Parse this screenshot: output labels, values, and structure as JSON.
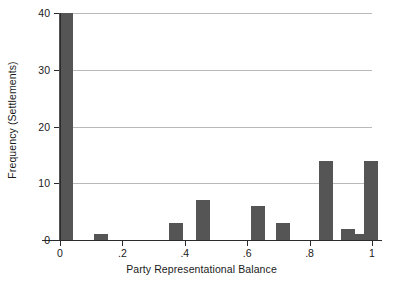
{
  "chart_data": {
    "type": "bar",
    "title": "",
    "xlabel": "Party Representational Balance",
    "ylabel": "Frequency (Settlements)",
    "xlim": [
      0,
      1
    ],
    "ylim": [
      0,
      40
    ],
    "grid": true,
    "legend": null,
    "bar_color": "#555555",
    "grid_color": "#b9b9b9",
    "axis_color": "#2b2b2b",
    "bin_width": 0.045,
    "xticks": [
      {
        "value": 0,
        "label": "0"
      },
      {
        "value": 0.2,
        "label": ".2"
      },
      {
        "value": 0.4,
        "label": ".4"
      },
      {
        "value": 0.6,
        "label": ".6"
      },
      {
        "value": 0.8,
        "label": ".8"
      },
      {
        "value": 1,
        "label": "1"
      }
    ],
    "yticks": [
      {
        "value": 0,
        "label": "0"
      },
      {
        "value": 10,
        "label": "10"
      },
      {
        "value": 20,
        "label": "20"
      },
      {
        "value": 30,
        "label": "30"
      },
      {
        "value": 40,
        "label": "40"
      }
    ],
    "x": [
      0.019,
      0.13,
      0.373,
      0.459,
      0.635,
      0.715,
      0.852,
      0.923,
      0.968,
      0.998
    ],
    "values": [
      40,
      1,
      3,
      7,
      6,
      3,
      14,
      2,
      1,
      14
    ],
    "bars": [
      {
        "x": 0.019,
        "value": 40
      },
      {
        "x": 0.13,
        "value": 1
      },
      {
        "x": 0.373,
        "value": 3
      },
      {
        "x": 0.459,
        "value": 7
      },
      {
        "x": 0.635,
        "value": 6
      },
      {
        "x": 0.715,
        "value": 3
      },
      {
        "x": 0.852,
        "value": 14
      },
      {
        "x": 0.923,
        "value": 2
      },
      {
        "x": 0.968,
        "value": 1
      },
      {
        "x": 0.998,
        "value": 14
      }
    ]
  }
}
